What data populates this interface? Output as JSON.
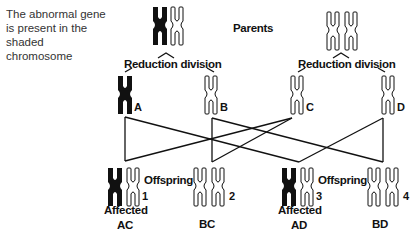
{
  "note": {
    "line1": "The abnormal gene",
    "line2": "is present in the shaded",
    "line3": "chromosome"
  },
  "header": {
    "parents_label": "Parents"
  },
  "division": {
    "left_label": "Reduction division",
    "right_label": "Reduction division"
  },
  "gametes": [
    {
      "id": "A",
      "shaded": true
    },
    {
      "id": "B",
      "shaded": false
    },
    {
      "id": "C",
      "shaded": false
    },
    {
      "id": "D",
      "shaded": false
    }
  ],
  "offspring": [
    {
      "number": "1",
      "genotype": "AC",
      "status": "Affected",
      "label": "Offspring"
    },
    {
      "number": "2",
      "genotype": "BC",
      "status": "",
      "label": ""
    },
    {
      "number": "3",
      "genotype": "AD",
      "status": "Affected",
      "label": "Offspring"
    },
    {
      "number": "4",
      "genotype": "BD",
      "status": "",
      "label": ""
    }
  ],
  "colors": {
    "shaded": "#111111",
    "outline": "#111111",
    "background": "#ffffff"
  }
}
